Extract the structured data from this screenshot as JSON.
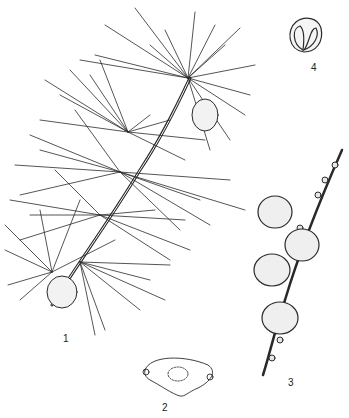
{
  "figure": {
    "type": "botanical line illustration",
    "panels": [
      {
        "id": "1",
        "label": "1",
        "description": "branch with needle clusters and cones"
      },
      {
        "id": "2",
        "label": "2",
        "description": "leaf scar outline"
      },
      {
        "id": "3",
        "label": "3",
        "description": "twig with cones"
      },
      {
        "id": "4",
        "label": "4",
        "description": "seed scale"
      }
    ],
    "colors": {
      "ink": "#2a2a2a",
      "background": "#ffffff"
    }
  }
}
